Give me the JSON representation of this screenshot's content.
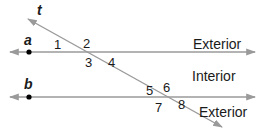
{
  "diagram": {
    "colors": {
      "line": "#9a9a9a",
      "text": "#1a1a1a",
      "point": "#000000",
      "background": "#ffffff"
    },
    "lines": {
      "a": {
        "label": "a",
        "y": 52,
        "x1": 10,
        "x2": 255,
        "point_x": 29
      },
      "b": {
        "label": "b",
        "y": 97,
        "x1": 10,
        "x2": 255,
        "point_x": 29
      },
      "t": {
        "label": "t",
        "x1": 28,
        "y1": 19,
        "x2": 222,
        "y2": 127
      }
    },
    "angles": [
      {
        "label": "1",
        "x": 58,
        "y": 49
      },
      {
        "label": "2",
        "x": 84,
        "y": 48
      },
      {
        "label": "3",
        "x": 85,
        "y": 67
      },
      {
        "label": "4",
        "x": 108,
        "y": 67
      },
      {
        "label": "5",
        "x": 147,
        "y": 94
      },
      {
        "label": "6",
        "x": 163,
        "y": 92
      },
      {
        "label": "7",
        "x": 155,
        "y": 112
      },
      {
        "label": "8",
        "x": 178,
        "y": 110
      }
    ],
    "regions": [
      {
        "label": "Exterior",
        "x": 193,
        "y": 51
      },
      {
        "label": "Interior",
        "x": 192,
        "y": 81
      },
      {
        "label": "Exterior",
        "x": 199,
        "y": 117
      }
    ]
  }
}
